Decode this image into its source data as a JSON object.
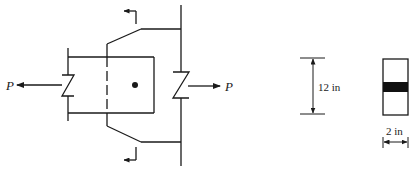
{
  "diagram": {
    "type": "bolted-gusset-connection",
    "load_left": {
      "label": "P",
      "direction": "left"
    },
    "load_right": {
      "label": "P",
      "direction": "right"
    },
    "section_marks": {
      "count": 2,
      "direction": "left"
    },
    "bolt": {
      "count": 1
    },
    "section_view": {
      "height_dimension": "12 in",
      "width_dimension": "2 in",
      "band_fill": "#111111"
    }
  },
  "colors": {
    "line": "#1a1a1a",
    "background": "#ffffff"
  }
}
